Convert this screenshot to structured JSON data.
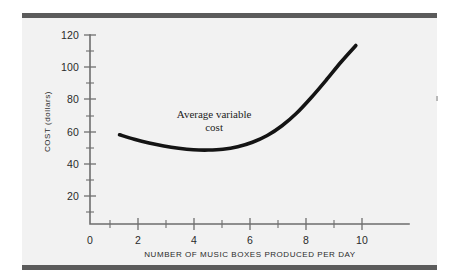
{
  "figure": {
    "background_color": "#f2f2f2",
    "rule_color": "#5b5b5b",
    "curve_color": "#141414"
  },
  "chart_data": {
    "type": "line",
    "title": "",
    "subtitle": "",
    "xlabel": "NUMBER OF MUSIC BOXES PRODUCED PER DAY",
    "ylabel": "COST (dollars)",
    "xlim": [
      0,
      10.8
    ],
    "ylim": [
      0,
      126
    ],
    "grid": false,
    "legend_position": "none",
    "x_ticks_major": [
      0,
      2,
      4,
      6,
      8,
      10
    ],
    "x_tick_labels": [
      "0",
      "2",
      "4",
      "6",
      "8",
      "10"
    ],
    "x_ticks_minor": [
      1,
      3,
      5,
      7,
      9
    ],
    "y_ticks_major": [
      20,
      40,
      60,
      80,
      100,
      120
    ],
    "y_tick_labels": [
      "20",
      "40",
      "60",
      "80",
      "100",
      "120"
    ],
    "y_ticks_minor": [
      30,
      50,
      70,
      90,
      110
    ],
    "series": [
      {
        "name": "Average variable cost",
        "x": [
          1.0,
          1.5,
          2.0,
          2.5,
          3.0,
          3.5,
          4.0,
          4.5,
          5.0,
          5.5,
          6.0,
          6.5,
          7.0,
          7.5,
          8.0,
          8.5,
          9.0
        ],
        "values": [
          59.5,
          56.5,
          54.0,
          52.0,
          50.5,
          49.5,
          49.3,
          49.8,
          51.5,
          54.5,
          59.0,
          65.5,
          74.0,
          84.5,
          96.0,
          108.0,
          119.0
        ]
      }
    ],
    "annotations": [
      {
        "name": "average-variable-cost-label",
        "line1": "Average variable",
        "line2": "cost",
        "x": 4.2,
        "y": 71
      }
    ]
  }
}
